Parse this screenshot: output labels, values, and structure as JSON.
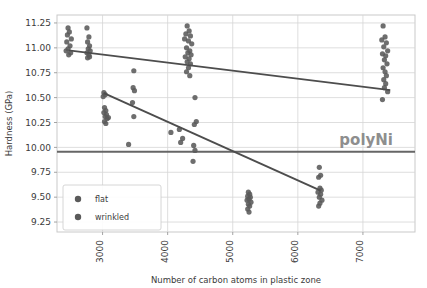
{
  "chart_data": {
    "type": "scatter",
    "title": "",
    "xlabel": "Number of carbon atoms in plastic zone",
    "ylabel": "Hardness (GPa)",
    "xlim": [
      2300,
      7800
    ],
    "ylim": [
      9.15,
      11.33
    ],
    "xticks": [
      3000,
      4000,
      5000,
      6000,
      7000
    ],
    "xtick_labels": [
      "3000",
      "4000",
      "5000",
      "6000",
      "7000"
    ],
    "yticks": [
      9.25,
      9.5,
      9.75,
      10.0,
      10.25,
      10.5,
      10.75,
      11.0,
      11.25
    ],
    "ytick_labels": [
      "9.25",
      "9.50",
      "9.75",
      "10.00",
      "10.25",
      "10.50",
      "10.75",
      "11.00",
      "11.25"
    ],
    "grid": true,
    "legend_position": "lower left",
    "marker_color": "#5a5a5a",
    "line_color": "#4d4d4d",
    "annotations": [
      {
        "text": "polyNi",
        "x": 7050,
        "y": 10.02,
        "color": "#8e8e8e"
      }
    ],
    "reference_lines": [
      {
        "name": "polyNi-hardness-line",
        "orientation": "horizontal",
        "y": 9.955,
        "color": "#666666"
      }
    ],
    "trend_lines": [
      {
        "name": "flat-trend",
        "x": [
          2480,
          7420
        ],
        "y": [
          10.975,
          10.575
        ],
        "color": "#4d4d4d"
      },
      {
        "name": "wrinkled-trend",
        "x": [
          3020,
          6350
        ],
        "y": [
          10.545,
          9.565
        ],
        "color": "#4d4d4d"
      }
    ],
    "series": [
      {
        "name": "flat",
        "marker": "circle",
        "color": "#5a5a5a",
        "points": [
          [
            2470,
            11.2
          ],
          [
            2490,
            11.16
          ],
          [
            2460,
            11.13
          ],
          [
            2520,
            11.09
          ],
          [
            2450,
            11.06
          ],
          [
            2500,
            11.02
          ],
          [
            2470,
            10.99
          ],
          [
            2440,
            10.97
          ],
          [
            2510,
            10.95
          ],
          [
            2480,
            10.93
          ],
          [
            2760,
            11.2
          ],
          [
            2790,
            11.11
          ],
          [
            2770,
            11.06
          ],
          [
            2800,
            11.02
          ],
          [
            2780,
            10.99
          ],
          [
            2810,
            10.97
          ],
          [
            2760,
            10.95
          ],
          [
            2790,
            10.93
          ],
          [
            2800,
            10.91
          ],
          [
            2770,
            10.9
          ],
          [
            3480,
            10.77
          ],
          [
            3470,
            10.6
          ],
          [
            3490,
            10.57
          ],
          [
            3460,
            10.45
          ],
          [
            3480,
            10.31
          ],
          [
            4300,
            11.22
          ],
          [
            4330,
            11.17
          ],
          [
            4280,
            11.14
          ],
          [
            4350,
            11.12
          ],
          [
            4260,
            11.09
          ],
          [
            4320,
            11.07
          ],
          [
            4370,
            11.04
          ],
          [
            4290,
            11.0
          ],
          [
            4340,
            10.97
          ],
          [
            4310,
            10.95
          ],
          [
            4360,
            10.93
          ],
          [
            4270,
            10.91
          ],
          [
            4330,
            10.89
          ],
          [
            4300,
            10.86
          ],
          [
            4350,
            10.84
          ],
          [
            4320,
            10.8
          ],
          [
            4290,
            10.76
          ],
          [
            4340,
            10.72
          ],
          [
            4420,
            10.5
          ],
          [
            4440,
            10.26
          ],
          [
            4410,
            10.23
          ],
          [
            7310,
            11.22
          ],
          [
            7340,
            11.11
          ],
          [
            7290,
            11.08
          ],
          [
            7360,
            11.05
          ],
          [
            7320,
            11.01
          ],
          [
            7380,
            10.97
          ],
          [
            7300,
            10.94
          ],
          [
            7350,
            10.92
          ],
          [
            7330,
            10.88
          ],
          [
            7370,
            10.84
          ],
          [
            7310,
            10.8
          ],
          [
            7340,
            10.76
          ],
          [
            7360,
            10.72
          ],
          [
            7320,
            10.68
          ],
          [
            7350,
            10.64
          ],
          [
            7330,
            10.6
          ],
          [
            7380,
            10.56
          ],
          [
            7300,
            10.48
          ]
        ]
      },
      {
        "name": "wrinkled",
        "marker": "circle",
        "color": "#5a5a5a",
        "points": [
          [
            3020,
            10.55
          ],
          [
            3040,
            10.53
          ],
          [
            3010,
            10.51
          ],
          [
            3030,
            10.4
          ],
          [
            3050,
            10.37
          ],
          [
            3020,
            10.35
          ],
          [
            3060,
            10.33
          ],
          [
            3040,
            10.31
          ],
          [
            3070,
            10.29
          ],
          [
            3030,
            10.26
          ],
          [
            3050,
            10.24
          ],
          [
            3090,
            10.3
          ],
          [
            3400,
            10.03
          ],
          [
            4050,
            10.15
          ],
          [
            4180,
            10.18
          ],
          [
            4230,
            10.09
          ],
          [
            4200,
            10.05
          ],
          [
            4400,
            10.02
          ],
          [
            4420,
            9.97
          ],
          [
            4390,
            9.86
          ],
          [
            5240,
            9.55
          ],
          [
            5260,
            9.53
          ],
          [
            5230,
            9.51
          ],
          [
            5270,
            9.5
          ],
          [
            5250,
            9.48
          ],
          [
            5220,
            9.47
          ],
          [
            5280,
            9.45
          ],
          [
            5240,
            9.43
          ],
          [
            5260,
            9.41
          ],
          [
            5230,
            9.38
          ],
          [
            5250,
            9.35
          ],
          [
            6330,
            9.8
          ],
          [
            6350,
            9.72
          ],
          [
            6320,
            9.7
          ],
          [
            6340,
            9.59
          ],
          [
            6360,
            9.57
          ],
          [
            6310,
            9.55
          ],
          [
            6350,
            9.53
          ],
          [
            6330,
            9.5
          ],
          [
            6370,
            9.47
          ],
          [
            6340,
            9.44
          ],
          [
            6320,
            9.41
          ]
        ]
      }
    ]
  },
  "legend": {
    "entries": [
      {
        "label": "flat"
      },
      {
        "label": "wrinkled"
      }
    ]
  }
}
